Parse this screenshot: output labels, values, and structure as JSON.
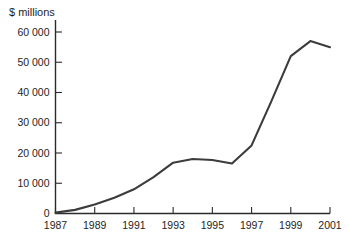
{
  "chart_data": {
    "type": "line",
    "title": "",
    "subtitle": "",
    "xlabel": "",
    "ylabel": "$ millions",
    "ylabel_position": "top-left",
    "grid": false,
    "legend": false,
    "legend_position": "none",
    "series_color": "#3c3c3c",
    "axis_color": "#2b2b2b",
    "background_color": "#ffffff",
    "xlim": [
      1987,
      2001
    ],
    "ylim": [
      0,
      60000
    ],
    "x": [
      1987,
      1988,
      1989,
      1990,
      1991,
      1992,
      1993,
      1994,
      1995,
      1996,
      1997,
      1998,
      1999,
      2000,
      2001
    ],
    "values": [
      300,
      1200,
      3000,
      5200,
      8000,
      12000,
      16800,
      18000,
      17700,
      16500,
      22500,
      37000,
      52000,
      57000,
      55000
    ],
    "series": [
      {
        "name": "$ millions",
        "values": [
          300,
          1200,
          3000,
          5200,
          8000,
          12000,
          16800,
          18000,
          17700,
          16500,
          22500,
          37000,
          52000,
          57000,
          55000
        ]
      }
    ],
    "x_tick_values": [
      1987,
      1989,
      1991,
      1993,
      1995,
      1997,
      1999,
      2001
    ],
    "x_tick_labels": [
      "1987",
      "1989",
      "1991",
      "1993",
      "1995",
      "1997",
      "1999",
      "2001"
    ],
    "y_tick_values": [
      0,
      10000,
      20000,
      30000,
      40000,
      50000,
      60000
    ],
    "y_tick_labels": [
      "0",
      "10 000",
      "20 000",
      "30 000",
      "40 000",
      "50 000",
      "60 000"
    ],
    "annotations": []
  }
}
